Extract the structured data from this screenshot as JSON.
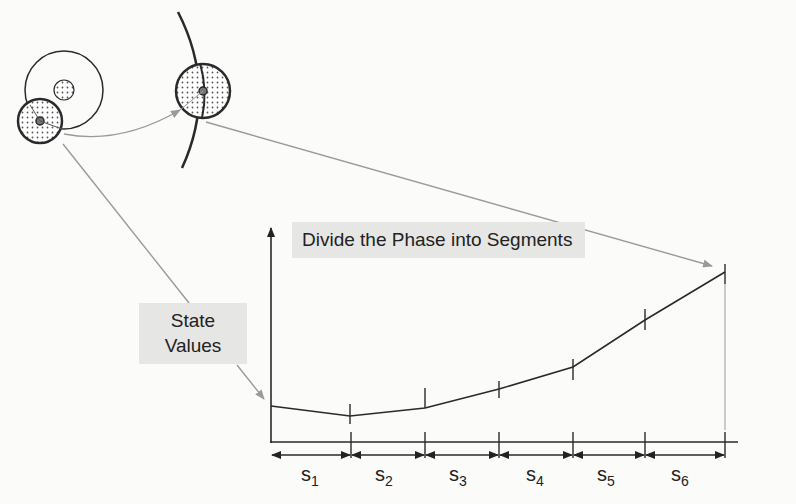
{
  "labels": {
    "divide": "Divide the Phase into Segments",
    "state_line1": "State",
    "state_line2": "Values"
  },
  "segments": [
    {
      "letter": "s",
      "index": "1"
    },
    {
      "letter": "s",
      "index": "2"
    },
    {
      "letter": "s",
      "index": "3"
    },
    {
      "letter": "s",
      "index": "4"
    },
    {
      "letter": "s",
      "index": "5"
    },
    {
      "letter": "s",
      "index": "6"
    }
  ],
  "colors": {
    "line": "#2a2a2a",
    "arrow_gray": "#9a9a9a",
    "label_bg": "#e6e6e4",
    "background": "#fbfbfa"
  }
}
